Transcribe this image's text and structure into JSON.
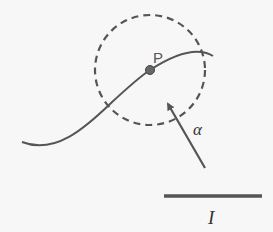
{
  "diagram": {
    "point_label": "P",
    "arrow_label": "α",
    "bar_label": "I",
    "colors": {
      "stroke": "#555555",
      "point_fill": "#666666",
      "background": "#f7f7f7"
    },
    "elements": [
      {
        "type": "dashed-circle",
        "center": [
          150,
          70
        ],
        "radius": 55
      },
      {
        "type": "curve",
        "description": "sinusoidal curve passing through P"
      },
      {
        "type": "point",
        "label": "P",
        "position": [
          150,
          70
        ]
      },
      {
        "type": "arrow",
        "label": "α",
        "from": [
          205,
          168
        ],
        "to": [
          166,
          100
        ]
      },
      {
        "type": "bar",
        "label": "I",
        "from": [
          164,
          196
        ],
        "to": [
          262,
          196
        ]
      }
    ]
  }
}
